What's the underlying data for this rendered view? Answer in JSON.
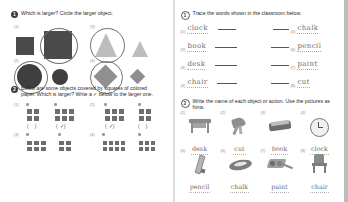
{
  "worksheet": {
    "left_page": {
      "q1": {
        "number": "1",
        "text": "Which is larger? Circle the larger object.",
        "items": [
          {
            "index": "(1)",
            "shape": "square",
            "answer_circled": "large"
          },
          {
            "index": "(2)",
            "shape": "circle",
            "answer_circled": "large"
          },
          {
            "index": "(3)",
            "shape": "triangle",
            "answer_circled": "large"
          },
          {
            "index": "(4)",
            "shape": "diamond",
            "answer_circled": "large"
          }
        ]
      },
      "q2": {
        "number": "2",
        "text": "Below are some objects covered by squares of colored paper. Which is larger? Write a ✓ below to the larger one.",
        "open_paren": "(",
        "close_paren": ")",
        "check_mark": "✓",
        "items": [
          {
            "index": "(1)",
            "left_cells": 4,
            "right_cells": 6,
            "checked": "right"
          },
          {
            "index": "(2)",
            "left_cells": 6,
            "right_cells": 4,
            "checked": "left"
          },
          {
            "index": "(3)",
            "left_cells": 6,
            "right_cells": 4,
            "checked": "left"
          },
          {
            "index": "(4)",
            "left_cells": 8,
            "right_cells": 6,
            "checked": "none"
          }
        ]
      }
    },
    "right_page": {
      "q1": {
        "number": "1",
        "text": "Trace the words shown in the classroom below.",
        "left_labels": [
          {
            "index": "(1)",
            "word": "clock"
          },
          {
            "index": "(2)",
            "word": "book"
          },
          {
            "index": "(3)",
            "word": "desk"
          },
          {
            "index": "(4)",
            "word": "chair"
          }
        ],
        "right_labels": [
          {
            "index": "(5)",
            "word": "chalk"
          },
          {
            "index": "(6)",
            "word": "pencil"
          },
          {
            "index": "(7)",
            "word": "paint"
          },
          {
            "index": "(8)",
            "word": "cut"
          }
        ],
        "scene_name": "classroom-illustration"
      },
      "q2": {
        "number": "2",
        "text": "Write the name of each object or action. Use the pictures as hints.",
        "items": [
          {
            "index": "(1)",
            "word": "desk",
            "icon": "desk-icon"
          },
          {
            "index": "(2)",
            "word": "cut",
            "icon": "scissors-icon"
          },
          {
            "index": "(3)",
            "word": "book",
            "icon": "book-icon"
          },
          {
            "index": "(4)",
            "word": "clock",
            "icon": "clock-icon"
          },
          {
            "index": "(5)",
            "word": "pencil",
            "icon": "pencil-icon"
          },
          {
            "index": "(6)",
            "word": "chalk",
            "icon": "chalk-icon"
          },
          {
            "index": "(7)",
            "word": "paint",
            "icon": "paint-icon"
          },
          {
            "index": "(8)",
            "word": "chair",
            "icon": "chair-icon"
          }
        ]
      }
    }
  }
}
